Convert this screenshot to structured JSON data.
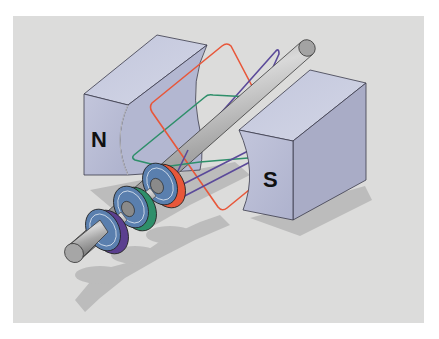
{
  "diagram": {
    "magnets": [
      {
        "id": "north",
        "label": "N"
      },
      {
        "id": "south",
        "label": "S"
      }
    ],
    "coils": [
      {
        "id": "coil-red",
        "color": "#e8573a"
      },
      {
        "id": "coil-green",
        "color": "#2e8f6a"
      },
      {
        "id": "coil-purple",
        "color": "#5b4a9a"
      }
    ],
    "slip_rings": [
      {
        "id": "ring-red",
        "rim_color": "#e8573a"
      },
      {
        "id": "ring-green",
        "rim_color": "#2e8f6a"
      },
      {
        "id": "ring-purple",
        "rim_color": "#5b3f8f"
      }
    ],
    "colors": {
      "background": "#dcdcdb",
      "magnet_front": "#b9bdd6",
      "magnet_top": "#c9cce0",
      "magnet_side": "#a9acc6",
      "shaft": "#9a9a9a",
      "ring_face": "#5a7fae",
      "shadow": "#bdbdbd"
    }
  }
}
